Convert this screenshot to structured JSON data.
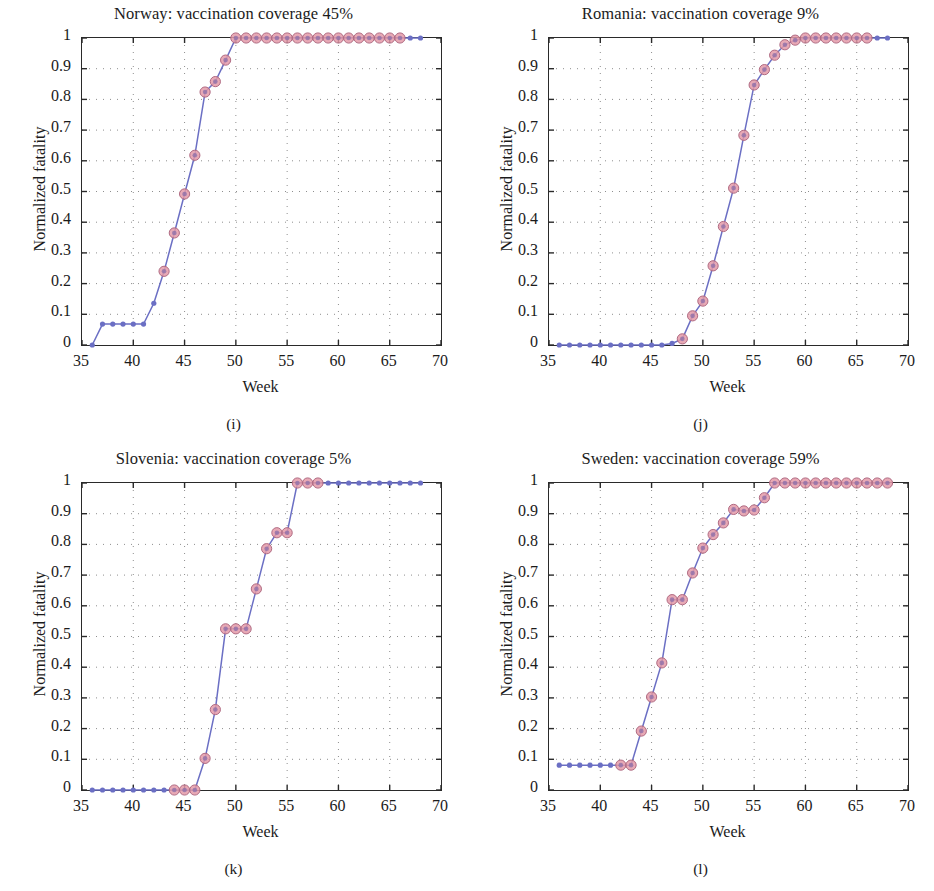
{
  "figure": {
    "panel_count": 4,
    "axis": {
      "xlabel": "Week",
      "ylabel": "Normalized fatality",
      "xlim": [
        35,
        70
      ],
      "ylim": [
        0,
        1
      ],
      "xticks": [
        35,
        40,
        45,
        50,
        55,
        60,
        65,
        70
      ],
      "xtick_labels": [
        "35",
        "40",
        "45",
        "50",
        "55",
        "60",
        "65",
        "70"
      ],
      "yticks": [
        0,
        0.1,
        0.2,
        0.3,
        0.4,
        0.5,
        0.6,
        0.7,
        0.8,
        0.9,
        1
      ],
      "ytick_labels": [
        "0",
        "0.1",
        "0.2",
        "0.3",
        "0.4",
        "0.5",
        "0.6",
        "0.7",
        "0.8",
        "0.9",
        "1"
      ],
      "grid": "dotted"
    },
    "style": {
      "line_color": "#6b6fc4",
      "marker_face_color": "#e49aa8",
      "marker_edge_color": "#b06a82",
      "small_marker_color": "#6b6fc4",
      "axis_color": "#2a2a2a",
      "grid_color": "#8e8e8e",
      "background": "#ffffff"
    },
    "captions": [
      "(i)",
      "(j)",
      "(k)",
      "(l)"
    ]
  },
  "chart_data": [
    {
      "type": "line",
      "panel": "(i)",
      "title": "Norway: vaccination coverage 45%",
      "country": "Norway",
      "vaccination_coverage": "45%",
      "xlabel": "Week",
      "ylabel": "Normalized fatality",
      "xlim": [
        35,
        70
      ],
      "ylim": [
        0,
        1
      ],
      "x": [
        36,
        37,
        38,
        39,
        40,
        41,
        42,
        43,
        44,
        45,
        46,
        47,
        48,
        49,
        50,
        51,
        52,
        53,
        54,
        55,
        56,
        57,
        58,
        59,
        60,
        61,
        62,
        63,
        64,
        65,
        66,
        67,
        68
      ],
      "values": [
        0,
        0.068,
        0.068,
        0.068,
        0.068,
        0.068,
        0.136,
        0.24,
        0.365,
        0.492,
        0.618,
        0.824,
        0.858,
        0.928,
        1,
        1,
        1,
        1,
        1,
        1,
        1,
        1,
        1,
        1,
        1,
        1,
        1,
        1,
        1,
        1,
        1,
        1,
        1
      ],
      "highlighted_from": 43,
      "highlighted_to": 66
    },
    {
      "type": "line",
      "panel": "(j)",
      "title": "Romania: vaccination coverage 9%",
      "country": "Romania",
      "vaccination_coverage": "9%",
      "xlabel": "Week",
      "ylabel": "Normalized fatality",
      "xlim": [
        35,
        70
      ],
      "ylim": [
        0,
        1
      ],
      "x": [
        36,
        37,
        38,
        39,
        40,
        41,
        42,
        43,
        44,
        45,
        46,
        47,
        48,
        49,
        50,
        51,
        52,
        53,
        54,
        55,
        56,
        57,
        58,
        59,
        60,
        61,
        62,
        63,
        64,
        65,
        66,
        67,
        68
      ],
      "values": [
        0,
        0,
        0,
        0,
        0,
        0,
        0,
        0,
        0,
        0,
        0,
        0.005,
        0.02,
        0.095,
        0.143,
        0.258,
        0.386,
        0.511,
        0.683,
        0.847,
        0.897,
        0.944,
        0.978,
        0.993,
        1,
        1,
        1,
        1,
        1,
        1,
        1,
        1,
        1
      ],
      "highlighted_from": 48,
      "highlighted_to": 66
    },
    {
      "type": "line",
      "panel": "(k)",
      "title": "Slovenia: vaccination coverage 5%",
      "country": "Slovenia",
      "vaccination_coverage": "5%",
      "xlabel": "Week",
      "ylabel": "Normalized fatality",
      "xlim": [
        35,
        70
      ],
      "ylim": [
        0,
        1
      ],
      "x": [
        36,
        37,
        38,
        39,
        40,
        41,
        42,
        43,
        44,
        45,
        46,
        47,
        48,
        49,
        50,
        51,
        52,
        53,
        54,
        55,
        56,
        57,
        58,
        59,
        60,
        61,
        62,
        63,
        64,
        65,
        66,
        67,
        68
      ],
      "values": [
        0,
        0,
        0,
        0,
        0,
        0,
        0,
        0,
        0,
        0,
        0,
        0.103,
        0.262,
        0.525,
        0.525,
        0.525,
        0.655,
        0.786,
        0.838,
        0.838,
        1,
        1,
        1,
        1,
        1,
        1,
        1,
        1,
        1,
        1,
        1,
        1,
        1
      ],
      "highlighted_from": 44,
      "highlighted_to": 58
    },
    {
      "type": "line",
      "panel": "(l)",
      "title": "Sweden: vaccination coverage 59%",
      "country": "Sweden",
      "vaccination_coverage": "59%",
      "xlabel": "Week",
      "ylabel": "Normalized fatality",
      "xlim": [
        35,
        70
      ],
      "ylim": [
        0,
        1
      ],
      "x": [
        36,
        37,
        38,
        39,
        40,
        41,
        42,
        43,
        44,
        45,
        46,
        47,
        48,
        49,
        50,
        51,
        52,
        53,
        54,
        55,
        56,
        57,
        58,
        59,
        60,
        61,
        62,
        63,
        64,
        65,
        66,
        67,
        68
      ],
      "values": [
        0.081,
        0.081,
        0.081,
        0.081,
        0.081,
        0.081,
        0.081,
        0.081,
        0.192,
        0.303,
        0.414,
        0.62,
        0.62,
        0.707,
        0.788,
        0.832,
        0.87,
        0.914,
        0.909,
        0.912,
        0.952,
        1,
        1,
        1,
        1,
        1,
        1,
        1,
        1,
        1,
        1,
        1,
        1
      ],
      "highlighted_from": 42,
      "highlighted_to": 68
    }
  ]
}
